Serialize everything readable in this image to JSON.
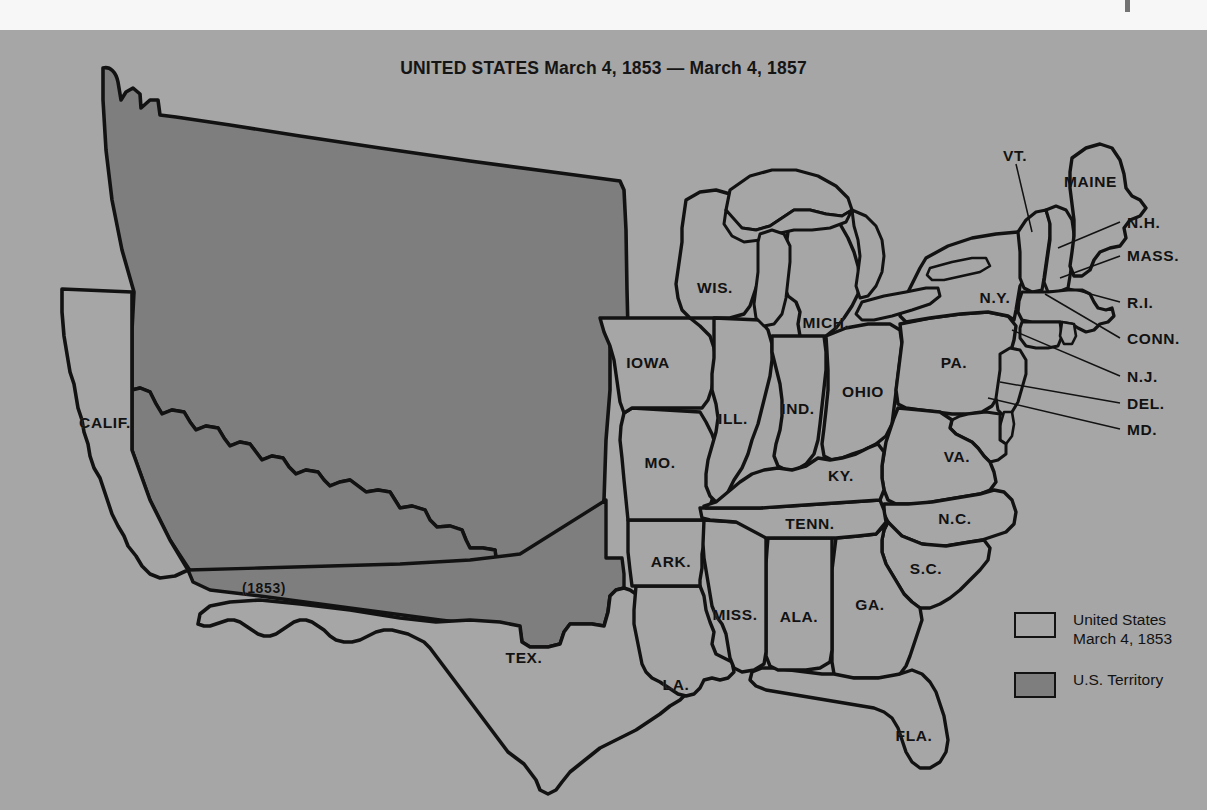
{
  "title": "UNITED STATES March 4, 1853 — March 4, 1857",
  "colors": {
    "background": "#a6a6a6",
    "state_fill": "#a6a6a6",
    "territory_fill": "#7e7e7e",
    "outline": "#121212",
    "paper_margin": "#f7f7f7"
  },
  "legend": {
    "items": [
      {
        "swatch": "state",
        "label": "United States\nMarch 4, 1853"
      },
      {
        "swatch": "territory",
        "label": "U.S. Territory"
      }
    ]
  },
  "annotations": {
    "gadsden": "(1853)"
  },
  "map_data": {
    "type": "choropleth-historical",
    "region": "contiguous United States",
    "period_start": "March 4, 1853",
    "period_end": "March 4, 1857",
    "categories": [
      "United States March 4, 1853",
      "U.S. Territory"
    ],
    "states": [
      {
        "name": "CALIF.",
        "category": "state",
        "x": 105,
        "y": 393
      },
      {
        "name": "WIS.",
        "category": "state",
        "x": 715,
        "y": 258
      },
      {
        "name": "MICH.",
        "category": "state",
        "x": 826,
        "y": 293
      },
      {
        "name": "IOWA",
        "category": "state",
        "x": 648,
        "y": 333
      },
      {
        "name": "ILL.",
        "category": "state",
        "x": 733,
        "y": 389
      },
      {
        "name": "IND.",
        "category": "state",
        "x": 798,
        "y": 379
      },
      {
        "name": "OHIO",
        "category": "state",
        "x": 863,
        "y": 362
      },
      {
        "name": "PA.",
        "category": "state",
        "x": 954,
        "y": 333
      },
      {
        "name": "N.Y.",
        "category": "state",
        "x": 995,
        "y": 268
      },
      {
        "name": "MO.",
        "category": "state",
        "x": 660,
        "y": 433
      },
      {
        "name": "KY.",
        "category": "state",
        "x": 841,
        "y": 446
      },
      {
        "name": "VA.",
        "category": "state",
        "x": 957,
        "y": 427
      },
      {
        "name": "TENN.",
        "category": "state",
        "x": 810,
        "y": 494
      },
      {
        "name": "N.C.",
        "category": "state",
        "x": 955,
        "y": 489
      },
      {
        "name": "ARK.",
        "category": "state",
        "x": 671,
        "y": 532
      },
      {
        "name": "S.C.",
        "category": "state",
        "x": 926,
        "y": 539
      },
      {
        "name": "MISS.",
        "category": "state",
        "x": 735,
        "y": 585
      },
      {
        "name": "ALA.",
        "category": "state",
        "x": 799,
        "y": 587
      },
      {
        "name": "GA.",
        "category": "state",
        "x": 870,
        "y": 575
      },
      {
        "name": "LA.",
        "category": "state",
        "x": 676,
        "y": 655
      },
      {
        "name": "TEX.",
        "category": "state",
        "x": 524,
        "y": 628
      },
      {
        "name": "FLA.",
        "category": "state",
        "x": 914,
        "y": 706
      }
    ],
    "callout_states": [
      {
        "name": "VT.",
        "label_x": 1003,
        "label_y": 156,
        "line_to_x": 1031,
        "line_to_y": 232
      },
      {
        "name": "MAINE",
        "label_x": 1064,
        "label_y": 182,
        "line_to_x": null,
        "line_to_y": null
      },
      {
        "name": "N.H.",
        "label_x": 1127,
        "label_y": 223,
        "line_to_x": 1063,
        "line_to_y": 246
      },
      {
        "name": "MASS.",
        "label_x": 1127,
        "label_y": 256,
        "line_to_x": 1067,
        "line_to_y": 276
      },
      {
        "name": "R.I.",
        "label_x": 1127,
        "label_y": 303,
        "line_to_x": 1071,
        "line_to_y": 289
      },
      {
        "name": "CONN.",
        "label_x": 1127,
        "label_y": 339,
        "line_to_x": 1057,
        "line_to_y": 293
      },
      {
        "name": "N.J.",
        "label_x": 1127,
        "label_y": 377,
        "line_to_x": 1030,
        "line_to_y": 340
      },
      {
        "name": "DEL.",
        "label_x": 1127,
        "label_y": 404,
        "line_to_x": 1025,
        "line_to_y": 386
      },
      {
        "name": "MD.",
        "label_x": 1127,
        "label_y": 430,
        "line_to_x": 1010,
        "line_to_y": 398
      }
    ],
    "territory_note": "Unorganized western territory shown in darker shading; Gadsden Purchase strip labeled (1853)"
  }
}
